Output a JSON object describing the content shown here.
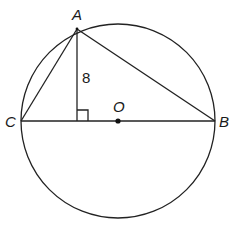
{
  "diagram": {
    "type": "circle-geometry",
    "points": {
      "A": {
        "label": "A"
      },
      "B": {
        "label": "B"
      },
      "C": {
        "label": "C"
      },
      "O": {
        "label": "O"
      }
    },
    "segments": [
      {
        "name": "AC",
        "from": "A",
        "to": "C"
      },
      {
        "name": "AB",
        "from": "A",
        "to": "B"
      },
      {
        "name": "CB",
        "from": "C",
        "to": "B",
        "role": "diameter"
      },
      {
        "name": "altitude",
        "from": "A",
        "to": "foot",
        "length_label": "8"
      }
    ],
    "annotations": {
      "altitude_length": "8",
      "right_angle_marker": true,
      "center_dot": true
    },
    "colors": {
      "stroke": "#222222",
      "background": "#ffffff"
    }
  }
}
